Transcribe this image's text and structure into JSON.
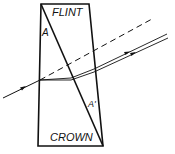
{
  "diagram": {
    "type": "achromatic-prism-ray-diagram",
    "labels": {
      "top_glass": "FLINT",
      "bottom_glass": "CROWN",
      "flint_angle": "A",
      "crown_angle": "A'"
    },
    "colors": {
      "line": "#111111",
      "background": "#ffffff"
    },
    "elements": {
      "prism_outline": "outer trapezoid of compound prism",
      "interface": "diagonal boundary between flint and crown glass",
      "incident_ray": "ray entering from left with arrow",
      "undeviated_reference": "dashed line continuing incident direction",
      "emergent_rays": "two nearly parallel dispersed rays exiting to the right with arrows"
    }
  }
}
